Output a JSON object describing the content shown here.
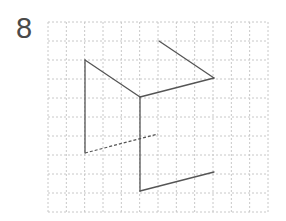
{
  "problem": {
    "number": "8"
  },
  "grid": {
    "left": 48,
    "top": 22,
    "right": 268,
    "bottom": 212,
    "cols": 12,
    "rows": 10,
    "line_color": "#c8c8c8"
  },
  "figure": {
    "stroke_color": "#555555",
    "solid_segments": [
      {
        "from": [
          85,
          60
        ],
        "to": [
          140,
          97
        ]
      },
      {
        "from": [
          140,
          97
        ],
        "to": [
          214,
          78
        ]
      },
      {
        "from": [
          159,
          41
        ],
        "to": [
          214,
          78
        ]
      },
      {
        "from": [
          85,
          60
        ],
        "to": [
          85,
          153
        ]
      },
      {
        "from": [
          140,
          97
        ],
        "to": [
          140,
          191
        ]
      },
      {
        "from": [
          140,
          191
        ],
        "to": [
          214,
          172
        ]
      }
    ],
    "dashed_segments": [
      {
        "from": [
          85,
          153
        ],
        "to": [
          158,
          134
        ]
      }
    ]
  }
}
